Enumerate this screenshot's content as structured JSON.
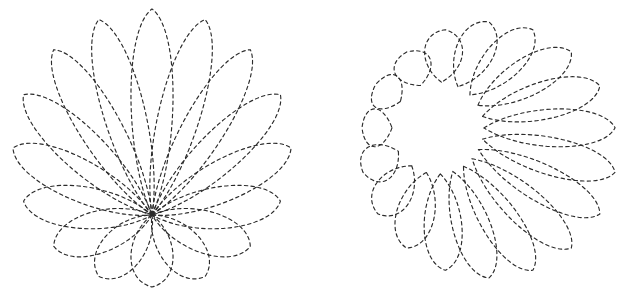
{
  "page": {
    "background_color": "#ffffff",
    "width": 633,
    "height": 295
  },
  "style": {
    "stroke_color": "#2b2b2b",
    "stroke_width": 1.15,
    "dash_on": 3.4,
    "dash_off": 3.2,
    "fill": "none"
  },
  "chart_data": {
    "type": "line",
    "title": "",
    "subtitle": "",
    "xlabel": "",
    "ylabel": "",
    "grid": false,
    "legend_position": "none",
    "axis_visible": false,
    "tick_labels": [],
    "annotations": [],
    "figures": [
      {
        "name": "left-rosette",
        "curve_family": "rose-epitrochoid",
        "petal_count": 16,
        "center": [
          152,
          148
        ],
        "pole": [
          152,
          215
        ],
        "outer_radius": 139,
        "petal_length": 132,
        "petal_width": 60,
        "petal_tilt_deg": 0,
        "start_angle_deg": -90,
        "hole_radius": 0,
        "bbox": [
          12,
          20,
          290,
          278
        ]
      },
      {
        "name": "right-rosette",
        "curve_family": "rose-epitrochoid",
        "petal_count": 18,
        "center": [
          489,
          150
        ],
        "pole": [
          438,
          128
        ],
        "outer_radius": 128,
        "petal_length": 120,
        "petal_width": 54,
        "petal_tilt_deg": 34,
        "start_angle_deg": -90,
        "hole_radius": 46,
        "bbox": [
          365,
          22,
          615,
          276
        ]
      }
    ]
  }
}
